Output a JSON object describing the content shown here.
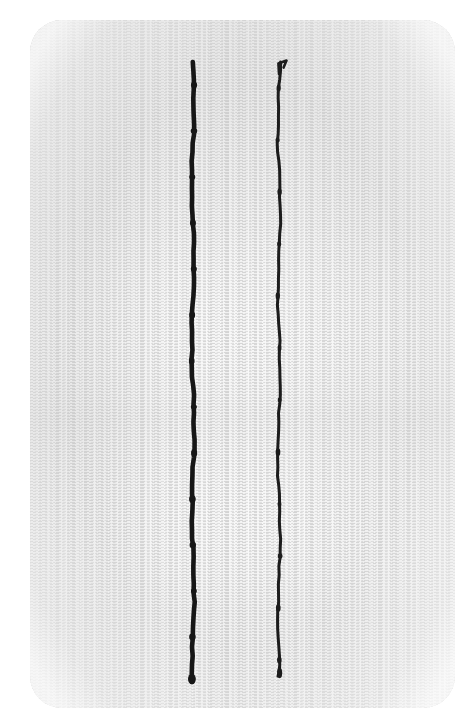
{
  "image": {
    "kind": "natural-image",
    "subject": "close-up photograph of two parallel dark stitched seams on light woven fabric",
    "width": 472,
    "height": 728,
    "background_color": "#ffffff"
  },
  "fabric": {
    "name": "fabric-swatch",
    "description": "light off-white woven textile swatch with fine horizontal weave rows",
    "base_color": "#fafafa",
    "weave_thread_color": "#d6d6d6",
    "weave_shadow_color": "#c2c2c2",
    "edge_x_left": 30,
    "edge_x_right": 455,
    "edge_y_top": 20,
    "edge_y_bottom": 708,
    "corner_radius": 32,
    "weave_row_pitch": 3,
    "denser_region": "upper-left quadrant"
  },
  "seams": [
    {
      "name": "left-seam",
      "label": "Left stitch line",
      "color": "#151515",
      "x_center": 193,
      "y_start": 62,
      "y_end": 682,
      "stroke_width": 4.6,
      "waviness": "slight side-to-side wander of about 2 px",
      "top_detail": "blunt thread end",
      "bottom_detail": "slightly thickened knot blob",
      "knot_interval": 46
    },
    {
      "name": "right-seam",
      "label": "Right stitch line",
      "color": "#1b1b1b",
      "x_center": 279,
      "y_start": 62,
      "y_end": 676,
      "stroke_width": 3.0,
      "waviness": "slight side-to-side wander of about 2 px",
      "top_detail": "small hook or flag of thread angling up and to the right",
      "bottom_detail": "rounded knot blob",
      "knot_interval": 52
    }
  ],
  "colors": {
    "canvas_white": "#ffffff",
    "fabric_white": "#fafafa",
    "weave_gray": "#d6d6d6",
    "weave_gray_dark": "#bdbdbd",
    "thread_black": "#151515"
  }
}
